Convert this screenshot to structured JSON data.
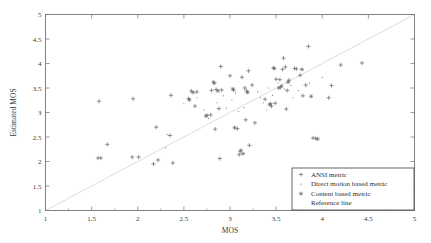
{
  "chart_data": {
    "type": "scatter",
    "title": "",
    "xlabel": "MOS",
    "ylabel": "Estimated MOS",
    "xlim": [
      1,
      5
    ],
    "ylim": [
      1,
      5
    ],
    "xticks": [
      "1",
      "1.5",
      "2",
      "2.5",
      "3",
      "3.5",
      "4",
      "4.5",
      "5"
    ],
    "yticks": [
      "1",
      "1.5",
      "2",
      "2.5",
      "3",
      "3.5",
      "4",
      "4.5",
      "5"
    ],
    "xtick_values": [
      1,
      1.5,
      2,
      2.5,
      3,
      3.5,
      4,
      4.5,
      5
    ],
    "ytick_values": [
      1,
      1.5,
      2,
      2.5,
      3,
      3.5,
      4,
      4.5,
      5
    ],
    "grid": false,
    "legend_position": "bottom-right",
    "marker_color": "#666666",
    "reference_line_color": "#d8d8d8",
    "axis_color": "#808080",
    "series": [
      {
        "name": "ANSI metric",
        "marker": "plus",
        "points": [
          [
            1.58,
            3.23
          ],
          [
            1.67,
            2.35
          ],
          [
            1.57,
            2.07
          ],
          [
            1.6,
            2.07
          ],
          [
            1.95,
            3.28
          ],
          [
            1.94,
            2.09
          ],
          [
            2.01,
            2.09
          ],
          [
            2.2,
            2.7
          ],
          [
            2.17,
            1.95
          ],
          [
            2.22,
            2.03
          ],
          [
            2.36,
            3.35
          ],
          [
            2.35,
            2.53
          ],
          [
            2.38,
            1.97
          ],
          [
            2.55,
            3.28
          ],
          [
            2.58,
            3.44
          ],
          [
            2.62,
            3.13
          ],
          [
            2.64,
            3.42
          ],
          [
            2.75,
            2.94
          ],
          [
            2.79,
            2.95
          ],
          [
            2.82,
            3.62
          ],
          [
            2.85,
            3.47
          ],
          [
            2.8,
            3.45
          ],
          [
            2.84,
            2.66
          ],
          [
            2.9,
            3.94
          ],
          [
            2.88,
            3.08
          ],
          [
            2.91,
            3.46
          ],
          [
            2.89,
            2.06
          ],
          [
            3.0,
            3.75
          ],
          [
            3.04,
            3.46
          ],
          [
            3.08,
            2.67
          ],
          [
            3.1,
            2.14
          ],
          [
            3.12,
            2.23
          ],
          [
            3.11,
            2.21
          ],
          [
            3.13,
            3.72
          ],
          [
            3.16,
            3.5
          ],
          [
            3.18,
            3.44
          ],
          [
            3.2,
            3.85
          ],
          [
            3.17,
            2.85
          ],
          [
            3.21,
            2.33
          ],
          [
            3.24,
            3.56
          ],
          [
            3.27,
            2.79
          ],
          [
            3.38,
            3.27
          ],
          [
            3.44,
            3.18
          ],
          [
            3.45,
            3.13
          ],
          [
            3.47,
            3.91
          ],
          [
            3.5,
            3.68
          ],
          [
            3.49,
            3.19
          ],
          [
            3.54,
            3.67
          ],
          [
            3.56,
            3.54
          ],
          [
            3.55,
            3.52
          ],
          [
            3.58,
            4.11
          ],
          [
            3.57,
            3.88
          ],
          [
            3.6,
            3.93
          ],
          [
            3.62,
            3.45
          ],
          [
            3.61,
            3.07
          ],
          [
            3.64,
            3.66
          ],
          [
            3.7,
            3.9
          ],
          [
            3.72,
            3.89
          ],
          [
            3.76,
            3.76
          ],
          [
            3.79,
            3.34
          ],
          [
            3.85,
            4.35
          ],
          [
            3.82,
            3.56
          ],
          [
            3.9,
            2.48
          ],
          [
            3.93,
            2.47
          ],
          [
            4.07,
            3.3
          ],
          [
            4.1,
            3.55
          ],
          [
            4.2,
            3.97
          ],
          [
            4.43,
            4.01
          ]
        ]
      },
      {
        "name": "Direct motion based metric",
        "marker": "dot",
        "points": [
          [
            2.3,
            2.28
          ],
          [
            2.32,
            2.55
          ],
          [
            2.64,
            3.3
          ],
          [
            2.72,
            3.05
          ],
          [
            2.86,
            3.2
          ],
          [
            2.93,
            3.34
          ],
          [
            2.96,
            3.09
          ],
          [
            3.02,
            3.25
          ],
          [
            3.06,
            3.4
          ],
          [
            3.09,
            3.02
          ],
          [
            3.3,
            3.42
          ],
          [
            3.33,
            3.3
          ],
          [
            3.36,
            3.2
          ],
          [
            3.42,
            3.5
          ],
          [
            3.46,
            3.35
          ],
          [
            3.52,
            3.6
          ],
          [
            3.59,
            3.48
          ],
          [
            3.66,
            3.55
          ],
          [
            3.68,
            3.3
          ],
          [
            3.74,
            3.45
          ],
          [
            2.5,
            3.18
          ],
          [
            2.77,
            2.88
          ],
          [
            3.15,
            3.1
          ],
          [
            3.4,
            3.05
          ],
          [
            3.86,
            3.6
          ],
          [
            4.0,
            3.72
          ]
        ]
      },
      {
        "name": "Content based metric",
        "marker": "asterisk",
        "points": [
          [
            2.74,
            2.93
          ],
          [
            2.83,
            3.6
          ],
          [
            2.87,
            3.44
          ],
          [
            3.03,
            3.48
          ],
          [
            3.19,
            3.41
          ],
          [
            3.43,
            3.16
          ],
          [
            3.48,
            3.9
          ],
          [
            3.53,
            3.5
          ],
          [
            3.63,
            3.62
          ],
          [
            3.78,
            3.88
          ],
          [
            3.88,
            3.33
          ],
          [
            3.95,
            2.46
          ],
          [
            3.05,
            2.69
          ],
          [
            3.14,
            2.16
          ],
          [
            2.6,
            3.41
          ],
          [
            2.56,
            3.26
          ]
        ]
      },
      {
        "name": "Reference line",
        "marker": "line",
        "points": [
          [
            1,
            1
          ],
          [
            5,
            5
          ]
        ]
      }
    ]
  },
  "legend": {
    "entries": [
      {
        "label": "ANSI metric",
        "marker": "plus"
      },
      {
        "label": "Direct motion based metric",
        "marker": "dot"
      },
      {
        "label": "Content based metric",
        "marker": "asterisk"
      },
      {
        "label": "Reference line",
        "marker": "line"
      }
    ]
  }
}
